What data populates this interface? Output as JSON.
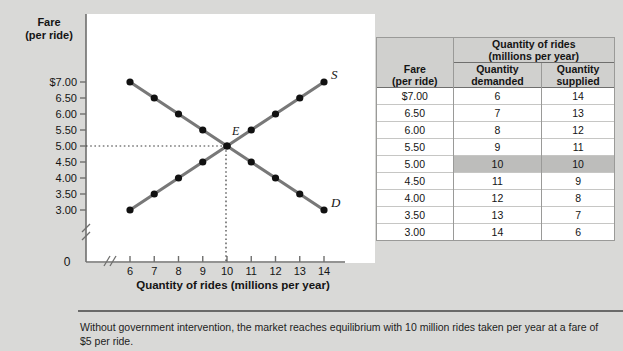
{
  "chart_data": {
    "type": "line",
    "title": "",
    "xlabel": "Quantity of rides (millions per year)",
    "ylabel": "Fare (per ride)",
    "ylabel_line1": "Fare",
    "ylabel_line2": "(per ride)",
    "xlim": [
      6,
      14
    ],
    "ylim": [
      3.0,
      7.0
    ],
    "x_ticks": [
      "6",
      "7",
      "8",
      "9",
      "10",
      "11",
      "12",
      "13",
      "14"
    ],
    "y_ticks": [
      "$7.00",
      "6.50",
      "6.00",
      "5.50",
      "5.00",
      "4.50",
      "4.00",
      "3.50",
      "3.00"
    ],
    "origin_label": "0",
    "grid": false,
    "axis_break_x": true,
    "axis_break_y": true,
    "x": [
      6,
      7,
      8,
      9,
      10,
      11,
      12,
      13,
      14
    ],
    "series": [
      {
        "name": "Demand",
        "label": "D",
        "values": [
          7.0,
          6.5,
          6.0,
          5.5,
          5.0,
          4.5,
          4.0,
          3.5,
          3.0
        ]
      },
      {
        "name": "Supply",
        "label": "S",
        "values": [
          3.0,
          3.5,
          4.0,
          4.5,
          5.0,
          5.5,
          6.0,
          6.5,
          7.0
        ]
      }
    ],
    "annotations": [
      {
        "label": "E",
        "x": 10,
        "y": 5.0,
        "note": "equilibrium point"
      }
    ],
    "equilibrium": {
      "quantity": 10,
      "fare": 5.0
    },
    "colors": {
      "curve": "#787878",
      "marker": "#111111",
      "panel": "#ffffff",
      "background": "#d9d9d7"
    }
  },
  "table": {
    "header_group": {
      "line1": "Quantity of rides",
      "line2": "(millions per year)"
    },
    "fare_header": {
      "line1": "Fare",
      "line2": "(per ride)"
    },
    "columns": [
      {
        "line1": "Quantity",
        "line2": "demanded"
      },
      {
        "line1": "Quantity",
        "line2": "supplied"
      }
    ],
    "rows": [
      {
        "fare": "$7.00",
        "demanded": "6",
        "supplied": "14",
        "highlight": false
      },
      {
        "fare": "6.50",
        "demanded": "7",
        "supplied": "13",
        "highlight": false
      },
      {
        "fare": "6.00",
        "demanded": "8",
        "supplied": "12",
        "highlight": false
      },
      {
        "fare": "5.50",
        "demanded": "9",
        "supplied": "11",
        "highlight": false
      },
      {
        "fare": "5.00",
        "demanded": "10",
        "supplied": "10",
        "highlight": true
      },
      {
        "fare": "4.50",
        "demanded": "11",
        "supplied": "9",
        "highlight": false
      },
      {
        "fare": "4.00",
        "demanded": "12",
        "supplied": "8",
        "highlight": false
      },
      {
        "fare": "3.50",
        "demanded": "13",
        "supplied": "7",
        "highlight": false
      },
      {
        "fare": "3.00",
        "demanded": "14",
        "supplied": "6",
        "highlight": false
      }
    ]
  },
  "caption": {
    "text": "Without government intervention, the market reaches equilibrium with 10 million rides taken per year at a fare of $5 per ride."
  }
}
